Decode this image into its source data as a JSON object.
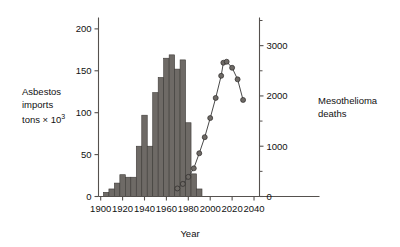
{
  "chart_data": {
    "type": "bar",
    "title": "",
    "xlabel": "Year",
    "ylabel": "Asbestos imports tons × 10³",
    "ylabel_line1": "Asbestos",
    "ylabel_line2": "imports",
    "ylabel_line3_pre": "tons × 10",
    "ylabel_line3_sup": "3",
    "y2label_line1": "Mesothelioma",
    "y2label_line2": "deaths",
    "xlim": [
      1898,
      2045
    ],
    "ylim": [
      0,
      210
    ],
    "y2lim": [
      0,
      3500
    ],
    "grid": false,
    "legend": "none",
    "xticks": [
      1900,
      1920,
      1940,
      1960,
      1980,
      2000,
      2020,
      2040
    ],
    "xticklabels": [
      "1900",
      "1920",
      "1940",
      "1960",
      "1980",
      "2000",
      "2020",
      "2040"
    ],
    "yticks": [
      0,
      50,
      100,
      150,
      200
    ],
    "yticklabels": [
      "0",
      "50",
      "100",
      "150",
      "200"
    ],
    "y2ticks": [
      0,
      1000,
      2000,
      3000
    ],
    "y2ticklabels": [
      "0",
      "1000",
      "2000",
      "3000"
    ],
    "y2minorticks": [
      500,
      1500,
      2500,
      3500
    ],
    "bar_color": "#6e6a66",
    "bar_edge_color": "#3d3a37",
    "line_color": "#4a4a4a",
    "marker_color": "#6e6a66",
    "axis_color": "#55514e",
    "series": [
      {
        "name": "Asbestos imports",
        "type": "bar",
        "axis": "left",
        "units": "tons × 10³",
        "bin_width": 5,
        "x": [
          1905,
          1910,
          1915,
          1920,
          1925,
          1930,
          1935,
          1940,
          1945,
          1950,
          1955,
          1960,
          1965,
          1970,
          1975,
          1980,
          1985,
          1990
        ],
        "values": [
          5,
          9,
          16,
          26,
          23,
          23,
          60,
          97,
          60,
          124,
          142,
          165,
          169,
          152,
          163,
          88,
          27,
          9
        ]
      },
      {
        "name": "Mesothelioma deaths",
        "type": "line",
        "axis": "right",
        "x": [
          1970,
          1975,
          1980,
          1985,
          1990,
          1995,
          2000,
          2005,
          2010,
          2012,
          2015,
          2020,
          2025,
          2030
        ],
        "values": [
          160,
          250,
          390,
          560,
          860,
          1180,
          1560,
          1960,
          2400,
          2660,
          2680,
          2560,
          2330,
          1920
        ]
      }
    ]
  }
}
